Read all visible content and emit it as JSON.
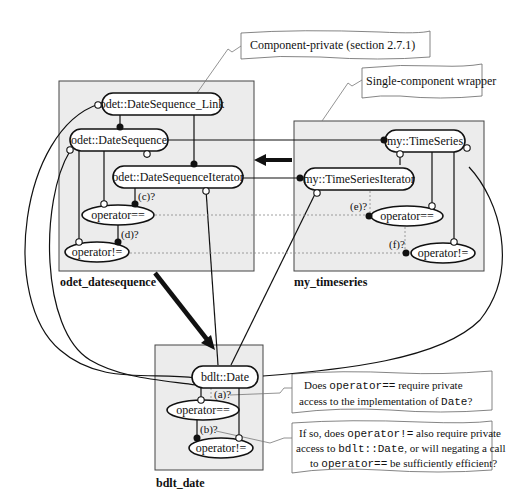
{
  "colors": {
    "package_fill": "#ececec",
    "line": "#111111",
    "note_fill": "#ffffff"
  },
  "packages": [
    {
      "id": "odet_datesequence",
      "label": "odet_datesequence"
    },
    {
      "id": "my_timeseries",
      "label": "my_timeseries"
    },
    {
      "id": "bdlt_date",
      "label": "bdlt_date"
    }
  ],
  "nodes": {
    "date_sequence_link": "odet::DateSequence_Link",
    "date_sequence": "odet::DateSequence",
    "date_sequence_iterator": "odet::DateSequenceIterator",
    "ds_op_eq": "operator==",
    "ds_op_ne": "operator!=",
    "time_series": "my::TimeSeries",
    "time_series_iterator": "my::TimeSeriesIterator",
    "ts_op_eq": "operator==",
    "ts_op_ne": "operator!=",
    "bdlt_date": "bdlt::Date",
    "bd_op_eq": "operator==",
    "bd_op_ne": "operator!="
  },
  "edge_labels": {
    "a": "(a)?",
    "b": "(b)?",
    "c": "(c)?",
    "d": "(d)?",
    "e": "(e)?",
    "f": "(f)?"
  },
  "notes": {
    "component_private": "Component-private (section 2.7.1)",
    "single_component_wrapper": "Single-component wrapper",
    "q1": {
      "line1_pre": "Does ",
      "line1_code": "operator==",
      "line1_post": " require private",
      "line2_pre": "access to the implementation of ",
      "line2_code": "Date",
      "line2_post": "?"
    },
    "q2": {
      "line1_pre": "If so, does ",
      "line1_code": "operator!=",
      "line1_post": " also require private",
      "line2_pre": "access to ",
      "line2_code": "bdlt::Date",
      "line2_post": ", or will negating a call",
      "line3_pre": "to ",
      "line3_code": "operator==",
      "line3_post": " be sufficiently efficient?"
    }
  }
}
